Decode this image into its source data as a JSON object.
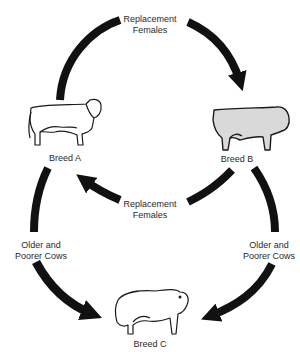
{
  "diagram": {
    "colors": {
      "arrow": "#111111",
      "outline": "#1a1a1a",
      "cow_fill_light": "#ffffff",
      "cow_fill_gray": "#d9d9d9"
    },
    "nodes": [
      {
        "id": "breed_a",
        "label": "Breed A",
        "icon": "hereford-cow-icon"
      },
      {
        "id": "breed_b",
        "label": "Breed B",
        "icon": "angus-cow-icon"
      },
      {
        "id": "breed_c",
        "label": "Breed C",
        "icon": "bull-icon"
      }
    ],
    "edges": [
      {
        "from": "breed_a",
        "to": "breed_b",
        "label_lines": [
          "Replacement",
          "Females"
        ]
      },
      {
        "from": "breed_b",
        "to": "breed_a",
        "label_lines": [
          "Replacement",
          "Females"
        ]
      },
      {
        "from": "breed_a",
        "to": "breed_c",
        "label_lines": [
          "Older and",
          "Poorer Cows"
        ]
      },
      {
        "from": "breed_b",
        "to": "breed_c",
        "label_lines": [
          "Older and",
          "Poorer Cows"
        ]
      }
    ]
  }
}
